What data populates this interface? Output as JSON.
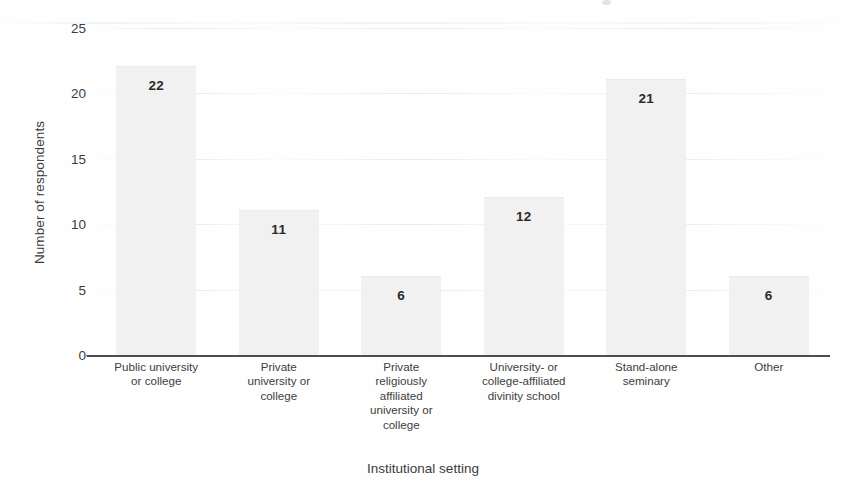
{
  "chart_data": {
    "type": "bar",
    "title": "",
    "subtitle": "",
    "xlabel": "Institutional setting",
    "ylabel": "Number of respondents",
    "categories": [
      "Public university or college",
      "Private university or college",
      "Private religiously affiliated university or college",
      "University- or college-affiliated divinity school",
      "Stand-alone seminary",
      "Other"
    ],
    "category_lines": [
      [
        "Public university",
        "or college"
      ],
      [
        "Private",
        "university or",
        "college"
      ],
      [
        "Private",
        "religiously",
        "affiliated",
        "university or",
        "college"
      ],
      [
        "University- or",
        "college-affiliated",
        "divinity school"
      ],
      [
        "Stand-alone",
        "seminary"
      ],
      [
        "Other"
      ]
    ],
    "values": [
      22,
      11,
      6,
      12,
      21,
      6
    ],
    "value_labels": [
      "22",
      "11",
      "6",
      "12",
      "21",
      "6"
    ],
    "ylim": [
      0,
      25
    ],
    "yticks": [
      0,
      5,
      10,
      15,
      20,
      25
    ],
    "ytick_labels": [
      "0",
      "5",
      "10",
      "15",
      "20",
      "25"
    ],
    "grid": false,
    "legend": null,
    "bar_color": "#f1f1f1",
    "axis_color": "#4d4d4d",
    "text_color": "#3d3d3d"
  }
}
